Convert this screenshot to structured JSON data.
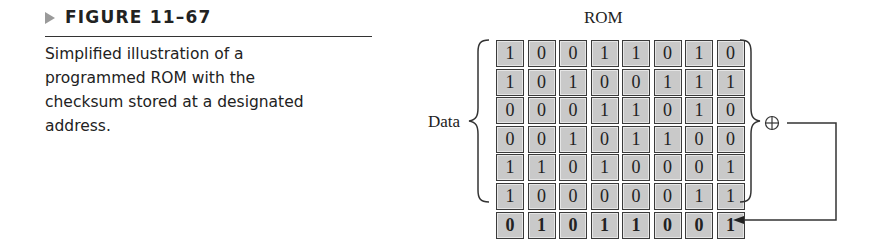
{
  "figure": {
    "label": "FIGURE 11–67",
    "caption_lines": [
      "Simplified illustration of a",
      "programmed ROM with the",
      "checksum stored at a designated",
      "address."
    ]
  },
  "diagram": {
    "title": "ROM",
    "data_label": "Data",
    "xor_symbol": "⊕",
    "data_rows": [
      [
        "1",
        "0",
        "0",
        "1",
        "1",
        "0",
        "1",
        "0"
      ],
      [
        "1",
        "0",
        "1",
        "0",
        "0",
        "1",
        "1",
        "1"
      ],
      [
        "0",
        "0",
        "0",
        "1",
        "1",
        "0",
        "1",
        "0"
      ],
      [
        "0",
        "0",
        "1",
        "0",
        "1",
        "1",
        "0",
        "0"
      ],
      [
        "1",
        "1",
        "0",
        "1",
        "0",
        "0",
        "0",
        "1"
      ],
      [
        "1",
        "0",
        "0",
        "0",
        "0",
        "0",
        "1",
        "1"
      ]
    ],
    "checksum_row": [
      "0",
      "1",
      "0",
      "1",
      "1",
      "0",
      "0",
      "1"
    ],
    "colors": {
      "cell_fill": "#c9c9c9",
      "cell_border": "#3a3a3a",
      "line": "#333333",
      "figure_arrow": "#9a9a9a"
    }
  }
}
